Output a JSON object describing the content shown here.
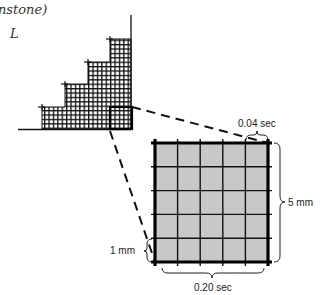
{
  "handwriting": {
    "text": "nstone)",
    "mark": "L"
  },
  "staircase": {
    "steps": 4,
    "fill_color": "#9a9a9a",
    "grid_color": "#111111"
  },
  "zoomed_box": {
    "divisions": 5,
    "fill_color": "#c8c8c8"
  },
  "labels": {
    "small_square_time": "0.04 sec",
    "large_square_height": "5 mm",
    "small_square_height": "1 mm",
    "large_square_time": "0.20 sec"
  }
}
